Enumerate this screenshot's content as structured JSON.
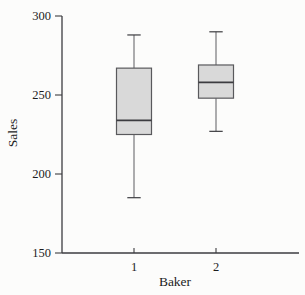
{
  "chart_data": {
    "type": "boxplot",
    "title": "",
    "xlabel": "Baker",
    "ylabel": "Sales",
    "categories": [
      "1",
      "2"
    ],
    "y_ticks": [
      150,
      200,
      250,
      300
    ],
    "ylim": [
      150,
      300
    ],
    "grid": false,
    "legend": "none",
    "series": [
      {
        "name": "Baker 1",
        "category": "1",
        "whisker_low": 185,
        "q1": 225,
        "median": 234,
        "q3": 267,
        "whisker_high": 288
      },
      {
        "name": "Baker 2",
        "category": "2",
        "whisker_low": 227,
        "q1": 248,
        "median": 258,
        "q3": 269,
        "whisker_high": 290
      }
    ],
    "colors": {
      "box_fill": "#d9d9d9",
      "box_border": "#59595c",
      "median": "#3c3c40",
      "whisker": "#5c5c60",
      "axis": "#3c3c40",
      "text": "#1d1d1d",
      "background": "#fcfcfb"
    }
  }
}
